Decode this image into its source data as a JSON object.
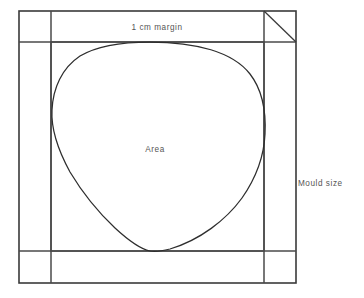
{
  "diagram": {
    "type": "technical-line-drawing",
    "colors": {
      "background": "#ffffff",
      "outer_frame_stroke": "#3a3a3a",
      "margin_stroke": "#4a4a4a",
      "area_curve_stroke": "#2e2e2e",
      "label_text": "#555555"
    },
    "labels": {
      "margin": "1 cm  margin",
      "area": "Area",
      "mould_size": "Mould size"
    },
    "geometry": {
      "outer_rect": {
        "x": 19,
        "y": 11,
        "width": 277,
        "height": 272
      },
      "margin_rect": {
        "x": 51,
        "y": 42,
        "width": 213,
        "height": 209
      },
      "bevel_line": {
        "x1": 264,
        "y1": 11,
        "x2": 296,
        "y2": 42
      },
      "area_shape": "rounded-teardrop",
      "area_tangent_top_y": 42,
      "area_tangent_bottom_y": 251,
      "area_leftmost_x": 52,
      "area_rightmost_x": 266
    },
    "label_positions": {
      "margin": {
        "x": 157,
        "y": 30
      },
      "area": {
        "x": 155,
        "y": 152
      },
      "mould_size": {
        "x": 298,
        "y": 186
      }
    }
  }
}
